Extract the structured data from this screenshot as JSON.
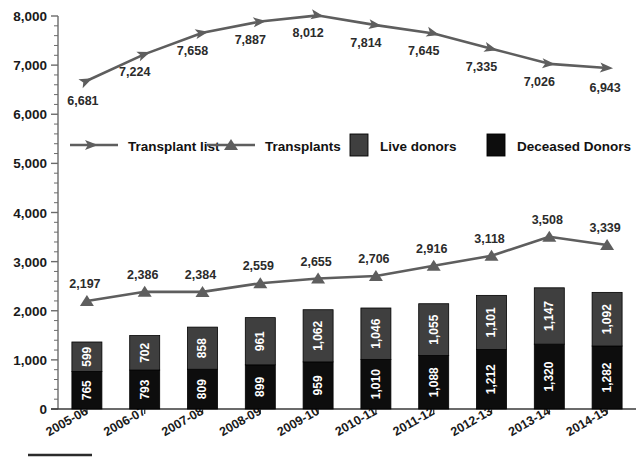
{
  "chart_data": {
    "type": "bar",
    "title": "",
    "subtitle": "",
    "xlabel": "",
    "ylabel": "",
    "ylim": [
      0,
      8000
    ],
    "y_ticks": [
      "0",
      "1,000",
      "2,000",
      "3,000",
      "4,000",
      "5,000",
      "6,000",
      "7,000",
      "8,000"
    ],
    "y_tick_values": [
      0,
      1000,
      2000,
      3000,
      4000,
      5000,
      6000,
      7000,
      8000
    ],
    "minor_ticks_per_interval": 5,
    "grid": false,
    "legend_position": "middle-center",
    "categories": [
      "2005-06",
      "2006-07",
      "2007-08",
      "2008-09",
      "2009-10",
      "2010-11",
      "2011-12",
      "2012-13",
      "2013-14",
      "2014-15"
    ],
    "series": [
      {
        "name": "Transplant list",
        "type": "line",
        "marker": "arrow",
        "color": "#5e5e5e",
        "values": [
          6681,
          7224,
          7658,
          7887,
          8012,
          7814,
          7645,
          7335,
          7026,
          6943
        ],
        "labels": [
          "6,681",
          "7,224",
          "7,658",
          "7,887",
          "8,012",
          "7,814",
          "7,645",
          "7,335",
          "7,026",
          "6,943"
        ]
      },
      {
        "name": "Transplants",
        "type": "line",
        "marker": "triangle",
        "color": "#5e5e5e",
        "values": [
          2197,
          2386,
          2384,
          2559,
          2655,
          2706,
          2916,
          3118,
          3508,
          3339
        ],
        "labels": [
          "2,197",
          "2,386",
          "2,384",
          "2,559",
          "2,655",
          "2,706",
          "2,916",
          "3,118",
          "3,508",
          "3,339"
        ]
      },
      {
        "name": "Live donors",
        "type": "bar-stack-top",
        "color": "#3f3f3f",
        "values": [
          599,
          702,
          858,
          961,
          1062,
          1046,
          1055,
          1101,
          1147,
          1092
        ],
        "labels": [
          "599",
          "702",
          "858",
          "961",
          "1,062",
          "1,046",
          "1,055",
          "1,101",
          "1,147",
          "1,092"
        ]
      },
      {
        "name": "Deceased Donors",
        "type": "bar-stack-bottom",
        "color": "#0d0d0d",
        "values": [
          765,
          793,
          809,
          899,
          959,
          1010,
          1088,
          1212,
          1320,
          1282
        ],
        "labels": [
          "765",
          "793",
          "809",
          "899",
          "959",
          "1,010",
          "1,088",
          "1,212",
          "1,320",
          "1,282"
        ]
      }
    ]
  },
  "legend": {
    "items": [
      {
        "label": "Transplant list",
        "marker": "arrow-line",
        "color": "#5e5e5e"
      },
      {
        "label": "Transplants",
        "marker": "triangle-line",
        "color": "#5e5e5e"
      },
      {
        "label": "Live donors",
        "marker": "swatch",
        "color": "#3f3f3f"
      },
      {
        "label": "Deceased Donors",
        "marker": "swatch",
        "color": "#0d0d0d"
      }
    ]
  },
  "axes": {
    "y_axis_color": "#6b6b6b",
    "x_axis_color": "#3a3a3a"
  },
  "footer": {
    "rule_color": "#2b2b2b"
  }
}
